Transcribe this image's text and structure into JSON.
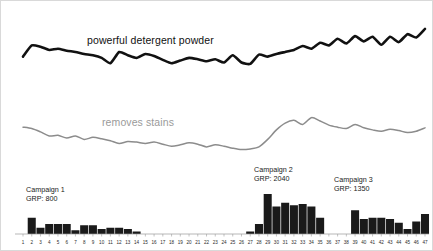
{
  "series_labels": {
    "black": "powerful detergent powder",
    "gray": "removes stains"
  },
  "annotations": [
    {
      "id": "c1",
      "name": "Campaign 1",
      "grp": "GRP: 800"
    },
    {
      "id": "c2",
      "name": "Campaign 2",
      "grp": "GRP: 2040"
    },
    {
      "id": "c3",
      "name": "Campaign 3",
      "grp": "GRP: 1350"
    }
  ],
  "colors": {
    "black_line": "#111111",
    "gray_line": "#8c8c8c",
    "bars": "#1a1a1a",
    "axis": "#9a9a9a",
    "background": "#ffffff"
  },
  "chart_data": {
    "type": "line",
    "title": "",
    "xlabel": "",
    "ylabel": "",
    "grid": false,
    "legend": "inline-labels",
    "x": [
      1,
      2,
      3,
      4,
      5,
      6,
      7,
      8,
      9,
      10,
      11,
      12,
      13,
      14,
      15,
      16,
      17,
      18,
      19,
      20,
      21,
      22,
      23,
      24,
      25,
      26,
      27,
      28,
      29,
      30,
      31,
      32,
      33,
      34,
      35,
      36,
      37,
      38,
      39,
      40,
      41,
      42,
      43,
      44,
      45,
      46,
      47
    ],
    "xtick_labels": [
      "1",
      "2",
      "3",
      "4",
      "5",
      "6",
      "7",
      "8",
      "9",
      "10",
      "11",
      "12",
      "13",
      "14",
      "15",
      "16",
      "17",
      "18",
      "19",
      "20",
      "21",
      "22",
      "23",
      "24",
      "25",
      "26",
      "27",
      "28",
      "29",
      "30",
      "31",
      "32",
      "33",
      "34",
      "35",
      "36",
      "37",
      "38",
      "39",
      "40",
      "41",
      "42",
      "43",
      "44",
      "45",
      "46",
      "47"
    ],
    "ylim": [
      0,
      100
    ],
    "series": [
      {
        "name": "powerful detergent powder",
        "color": "#111111",
        "values": [
          40,
          57,
          55,
          50,
          52,
          49,
          47,
          44,
          42,
          38,
          30,
          47,
          42,
          38,
          44,
          41,
          35,
          30,
          34,
          38,
          36,
          33,
          36,
          31,
          42,
          31,
          29,
          43,
          40,
          44,
          47,
          50,
          56,
          52,
          61,
          57,
          67,
          60,
          71,
          63,
          70,
          58,
          70,
          62,
          74,
          69,
          82
        ]
      },
      {
        "name": "removes stains",
        "color": "#8c8c8c",
        "values": [
          38,
          36,
          31,
          25,
          26,
          22,
          25,
          20,
          23,
          21,
          18,
          14,
          17,
          16,
          14,
          16,
          13,
          10,
          12,
          15,
          13,
          9,
          12,
          10,
          7,
          5,
          6,
          9,
          20,
          34,
          44,
          48,
          42,
          52,
          47,
          41,
          38,
          36,
          42,
          37,
          34,
          32,
          35,
          33,
          30,
          32,
          37
        ]
      }
    ],
    "bars": {
      "type": "bar",
      "name": "GRP",
      "color": "#1a1a1a",
      "categories": [
        1,
        2,
        3,
        4,
        5,
        6,
        7,
        8,
        9,
        10,
        11,
        12,
        13,
        14,
        15,
        16,
        17,
        18,
        19,
        20,
        21,
        22,
        23,
        24,
        25,
        26,
        27,
        28,
        29,
        30,
        31,
        32,
        33,
        34,
        35,
        36,
        37,
        38,
        39,
        40,
        41,
        42,
        43,
        44,
        45,
        46,
        47
      ],
      "values": [
        0,
        13,
        5,
        8,
        8,
        8,
        3,
        7,
        7,
        4,
        5,
        5,
        4,
        2,
        0,
        0,
        0,
        0,
        0,
        0,
        0,
        0,
        0,
        0,
        0,
        0,
        2,
        8,
        32,
        22,
        25,
        23,
        24,
        22,
        13,
        0,
        0,
        0,
        19,
        12,
        13,
        13,
        12,
        9,
        4,
        10,
        16
      ]
    }
  }
}
